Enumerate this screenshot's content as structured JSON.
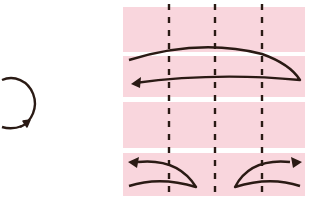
{
  "diagram": {
    "type": "origami-fold-instruction",
    "colors": {
      "paper": "#f9d6dd",
      "paper_separator": "#ffffff",
      "stroke": "#2a1a14",
      "background": "#ffffff"
    },
    "rotate_symbol": {
      "icon": "rotate-clockwise-icon",
      "meaning": "turn over / rotate"
    },
    "strips": [
      {
        "id": 1,
        "x": 123,
        "y": 7,
        "w": 182,
        "h": 45
      },
      {
        "id": 2,
        "x": 123,
        "y": 56,
        "w": 182,
        "h": 41
      },
      {
        "id": 3,
        "x": 123,
        "y": 102,
        "w": 182,
        "h": 46
      },
      {
        "id": 4,
        "x": 123,
        "y": 153,
        "w": 182,
        "h": 43
      }
    ],
    "fold_lines": [
      {
        "x": 169,
        "style": "valley-dashed"
      },
      {
        "x": 215,
        "style": "valley-dashed"
      },
      {
        "x": 262,
        "style": "valley-dashed"
      }
    ],
    "arrows": [
      {
        "name": "fold-right-to-left-arrow",
        "description": "Long arrow folding right edge over to the left"
      },
      {
        "name": "fold-left-corner-arrow",
        "description": "Small arrow folding lower-left outward"
      },
      {
        "name": "fold-right-corner-arrow",
        "description": "Small arrow folding lower-right outward"
      }
    ]
  }
}
